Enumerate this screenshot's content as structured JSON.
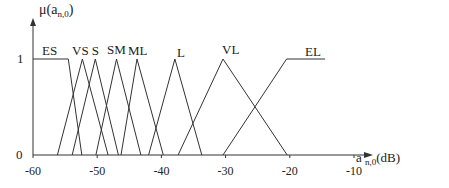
{
  "chart_data": {
    "type": "line",
    "title": "",
    "ylabel": "μ(a_n,0)",
    "xlabel": "a n,0 (dB)",
    "xlim": [
      -60,
      -5
    ],
    "ylim": [
      0,
      1
    ],
    "grid": false,
    "x_ticks": [
      "-60",
      "-50",
      "-40",
      "-30",
      "-20",
      "-10"
    ],
    "y_ticks": [
      "0",
      "1"
    ],
    "series": [
      {
        "name": "ES",
        "x": [
          -60,
          -54.5,
          -52.4
        ],
        "y": [
          1,
          1,
          0
        ]
      },
      {
        "name": "VS",
        "x": [
          -56.2,
          -52.3,
          -48.3
        ],
        "y": [
          0,
          1,
          0
        ]
      },
      {
        "name": "S",
        "x": [
          -53.9,
          -50.3,
          -46.7
        ],
        "y": [
          0,
          1,
          0
        ]
      },
      {
        "name": "SM",
        "x": [
          -50.2,
          -47.0,
          -43.2
        ],
        "y": [
          0,
          1,
          0
        ]
      },
      {
        "name": "ML",
        "x": [
          -46.3,
          -43.8,
          -39.7
        ],
        "y": [
          0,
          1,
          0
        ]
      },
      {
        "name": "L",
        "x": [
          -42.0,
          -37.9,
          -33.7
        ],
        "y": [
          0,
          1,
          0
        ]
      },
      {
        "name": "VL",
        "x": [
          -37.4,
          -30.4,
          -20.4
        ],
        "y": [
          0,
          1,
          0
        ]
      },
      {
        "name": "EL",
        "x": [
          -30.4,
          -20.5,
          -14.5
        ],
        "y": [
          0,
          1,
          1
        ]
      }
    ]
  },
  "labels": {
    "y_axis_mu": "μ(a",
    "y_axis_sub": "n,0",
    "y_axis_close": ")",
    "x_axis_a": "a",
    "x_axis_sub": "n,0",
    "x_axis_unit": "(dB)",
    "y_one": "1",
    "y_zero": "0",
    "sets": [
      "ES",
      "VS S",
      "SM",
      "ML",
      "L",
      "VL",
      "EL"
    ]
  }
}
